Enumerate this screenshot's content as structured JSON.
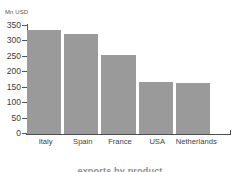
{
  "chart_data": {
    "type": "bar",
    "title": "",
    "subtitle": "",
    "xlabel": "",
    "ylabel": "Mn USD",
    "categories": [
      "Italy",
      "Spain",
      "France",
      "USA",
      "Netherlands"
    ],
    "values": [
      335,
      322,
      255,
      168,
      164
    ],
    "ylim": [
      0,
      350
    ],
    "ytick_labels": [
      "0",
      "50",
      "100",
      "150",
      "200",
      "250",
      "300",
      "350"
    ],
    "ytick_values": [
      0,
      50,
      100,
      150,
      200,
      250,
      300,
      350
    ],
    "grid": false,
    "legend": null,
    "series": [
      {
        "name": "",
        "values": [
          335,
          322,
          255,
          168,
          164
        ]
      }
    ],
    "bar_color": "#9a9a9a",
    "axis_color": "#56565a",
    "text_color": "#3b3b3d"
  },
  "caption": {
    "clipped_text": "exports by product"
  }
}
